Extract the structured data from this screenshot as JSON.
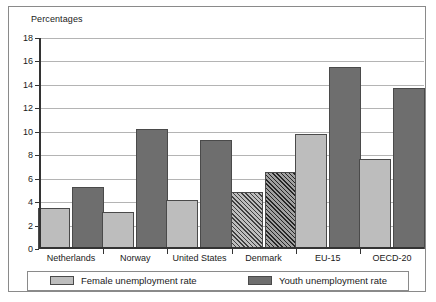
{
  "figure": {
    "title": "Percentages"
  },
  "chart_data": {
    "type": "bar",
    "title": "Percentages",
    "xlabel": "",
    "ylabel": "Percentages",
    "ylim": [
      0,
      18
    ],
    "yticks": [
      0,
      2,
      4,
      6,
      8,
      10,
      12,
      14,
      16,
      18
    ],
    "ytick_labels": [
      "0",
      "2",
      "4",
      "6",
      "8",
      "10",
      "12",
      "14",
      "16",
      "18"
    ],
    "grid": true,
    "legend_position": "bottom",
    "categories": [
      "Netherlands",
      "Norway",
      "United States",
      "Denmark",
      "EU-15",
      "OECD-20"
    ],
    "series": [
      {
        "name": "Female unemployment rate",
        "color": "#bdbdbd",
        "values": [
          3.5,
          3.2,
          4.2,
          4.9,
          9.8,
          7.7
        ],
        "hatched": [
          false,
          false,
          false,
          true,
          false,
          false
        ]
      },
      {
        "name": "Youth unemployment rate",
        "color": "#6e6e6e",
        "values": [
          5.3,
          10.2,
          9.3,
          6.6,
          15.5,
          13.7
        ],
        "hatched": [
          false,
          false,
          false,
          true,
          false,
          false
        ]
      }
    ]
  },
  "legend": {
    "entries": [
      {
        "label": "Female unemployment rate",
        "key": "female"
      },
      {
        "label": "Youth unemployment rate",
        "key": "youth"
      }
    ]
  }
}
